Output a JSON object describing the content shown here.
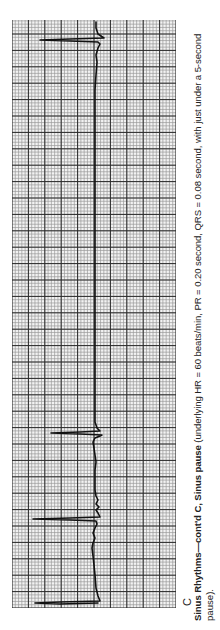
{
  "figure": {
    "panel_label": "C",
    "caption": {
      "title_bold": "Sinus Rhythms—cont'd C, Sinus pause",
      "body_line1": " (underlying HR = 60 beats/min, PR = 0.20 second, QRS = 0.08 second, with just under a 5-second",
      "body_line2": "pause)."
    },
    "orientation": "rotated -90deg (time runs bottom-to-top, QRS deflections point left)"
  },
  "colors": {
    "paper": "#f2f2f2",
    "minor_grid": "#9a9a9a",
    "major_grid": "#2a2a2a",
    "trace": "#111111",
    "text": "#222222"
  },
  "chart_data": {
    "type": "line",
    "title": "Sinus pause",
    "subtitle": "Sinus Rhythms—cont'd C",
    "xlabel": "Time (ECG paper, 0.04 s per small box, 0.20 s per large box)",
    "ylabel": "Amplitude",
    "grid": true,
    "grid_spec": {
      "large_boxes_across": 10,
      "large_boxes_along": 35.5,
      "small_per_large": 5
    },
    "measurements": {
      "underlying_hr_bpm": 60,
      "pr_interval_s": 0.2,
      "qrs_duration_s": 0.08,
      "pause": "just under 5 seconds"
    },
    "beats": [
      {
        "index": 1,
        "time_s": 0.0,
        "r_amplitude_rel": 1.0
      },
      {
        "index": 2,
        "time_s": 0.98,
        "r_amplitude_rel": 1.0
      },
      {
        "index": 3,
        "time_s": 2.03,
        "r_amplitude_rel": 0.78
      },
      {
        "index": 4,
        "time_s": 6.9,
        "r_amplitude_rel": 0.92
      }
    ],
    "trace_points_px": [
      [
        98,
        603
      ],
      [
        60,
        604
      ],
      [
        35,
        603
      ],
      [
        60,
        602
      ],
      [
        100,
        601
      ],
      [
        98,
        596
      ],
      [
        96,
        588
      ],
      [
        95,
        575
      ],
      [
        94,
        565
      ],
      [
        93,
        556
      ],
      [
        92,
        548
      ],
      [
        93,
        543
      ],
      [
        95,
        538
      ],
      [
        93,
        533
      ],
      [
        95,
        528
      ],
      [
        97,
        524
      ],
      [
        96,
        521
      ],
      [
        70,
        520
      ],
      [
        33,
        519
      ],
      [
        70,
        518
      ],
      [
        100,
        517
      ],
      [
        98,
        513
      ],
      [
        96,
        510
      ],
      [
        99,
        507
      ],
      [
        96,
        504
      ],
      [
        98,
        500
      ],
      [
        96,
        496
      ],
      [
        95,
        490
      ],
      [
        95,
        480
      ],
      [
        95,
        470
      ],
      [
        96,
        462
      ],
      [
        95,
        455
      ],
      [
        94,
        448
      ],
      [
        93,
        442
      ],
      [
        95,
        438
      ],
      [
        100,
        436
      ],
      [
        102,
        435
      ],
      [
        80,
        434
      ],
      [
        51,
        433
      ],
      [
        80,
        432
      ],
      [
        100,
        431
      ],
      [
        97,
        428
      ],
      [
        95,
        422
      ],
      [
        95,
        410
      ],
      [
        95,
        390
      ],
      [
        95,
        370
      ],
      [
        95,
        340
      ],
      [
        95,
        300
      ],
      [
        95,
        260
      ],
      [
        95,
        220
      ],
      [
        95,
        180
      ],
      [
        95,
        140
      ],
      [
        95,
        110
      ],
      [
        95,
        90
      ],
      [
        96,
        75
      ],
      [
        97,
        62
      ],
      [
        96,
        55
      ],
      [
        98,
        48
      ],
      [
        100,
        44
      ],
      [
        98,
        42
      ],
      [
        70,
        41
      ],
      [
        40,
        40
      ],
      [
        70,
        39
      ],
      [
        104,
        38
      ],
      [
        98,
        34
      ],
      [
        96,
        28
      ],
      [
        96,
        22
      ]
    ]
  }
}
